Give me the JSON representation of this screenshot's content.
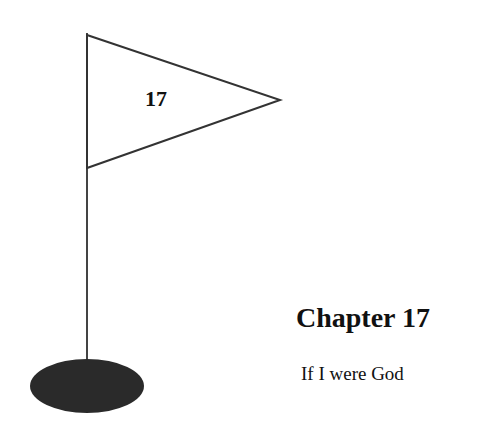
{
  "flag": {
    "number": "17"
  },
  "chapter": {
    "title": "Chapter 17",
    "subtitle": "If I were God"
  },
  "colors": {
    "background": "#ffffff",
    "line": "#333333",
    "hole": "#2a2a2a"
  }
}
